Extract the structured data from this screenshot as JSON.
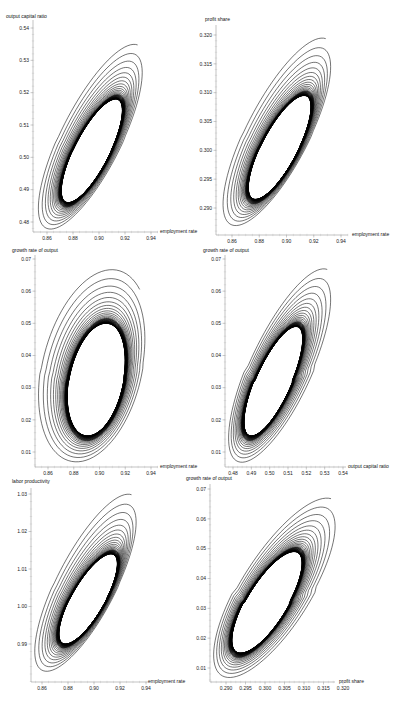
{
  "chart_data": [
    {
      "id": "c1",
      "type": "line",
      "title": "",
      "xlabel": "employment rate",
      "ylabel": "output capital ratio",
      "xlim": [
        0.85,
        0.95
      ],
      "ylim": [
        0.477,
        0.54
      ],
      "xticks": [
        0.86,
        0.88,
        0.9,
        0.92,
        0.94
      ],
      "xtick_labels": [
        "0.86",
        "0.88",
        "0.90",
        "0.92",
        "0.94"
      ],
      "yticks": [
        0.48,
        0.49,
        0.5,
        0.51,
        0.52,
        0.53,
        0.54
      ],
      "ytick_labels": [
        "0.48",
        "0.49",
        "0.50",
        "0.51",
        "0.52",
        "0.53",
        "0.54"
      ],
      "series": [
        {
          "name": "trajectory",
          "description": "spiral converging inward to a stable limit cycle",
          "start": [
            0.912,
            0.533
          ],
          "outer_orbit": {
            "x_range": [
              0.852,
              0.936
            ],
            "y_range": [
              0.477,
              0.535
            ]
          },
          "limit_cycle": {
            "x_range": [
              0.871,
              0.918
            ],
            "y_range": [
              0.486,
              0.518
            ]
          }
        }
      ]
    },
    {
      "id": "c2",
      "type": "line",
      "title": "",
      "xlabel": "employment rate",
      "ylabel": "profit share",
      "xlim": [
        0.85,
        0.95
      ],
      "ylim": [
        0.286,
        0.321
      ],
      "xticks": [
        0.86,
        0.88,
        0.9,
        0.92,
        0.94
      ],
      "xtick_labels": [
        "0.86",
        "0.88",
        "0.90",
        "0.92",
        "0.94"
      ],
      "yticks": [
        0.29,
        0.295,
        0.3,
        0.305,
        0.31,
        0.315,
        0.32
      ],
      "ytick_labels": [
        "0.290",
        "0.295",
        "0.300",
        "0.305",
        "0.310",
        "0.315",
        "0.320"
      ],
      "series": [
        {
          "name": "trajectory",
          "description": "spiral converging inward to a stable limit cycle",
          "start": [
            0.912,
            0.3175
          ],
          "outer_orbit": {
            "x_range": [
              0.852,
              0.935
            ],
            "y_range": [
              0.2865,
              0.3195
            ]
          },
          "limit_cycle": {
            "x_range": [
              0.872,
              0.918
            ],
            "y_range": [
              0.2915,
              0.3095
            ]
          }
        }
      ]
    },
    {
      "id": "c3",
      "type": "line",
      "title": "",
      "xlabel": "employment rate",
      "ylabel": "growth rate of output",
      "xlim": [
        0.85,
        0.95
      ],
      "ylim": [
        0.005,
        0.07
      ],
      "xticks": [
        0.86,
        0.88,
        0.9,
        0.92,
        0.94
      ],
      "xtick_labels": [
        "0.86",
        "0.88",
        "0.90",
        "0.92",
        "0.94"
      ],
      "yticks": [
        0.01,
        0.02,
        0.03,
        0.04,
        0.05,
        0.06,
        0.07
      ],
      "ytick_labels": [
        "0.01",
        "0.02",
        "0.03",
        "0.04",
        "0.05",
        "0.06",
        "0.07"
      ],
      "series": [
        {
          "name": "trajectory",
          "description": "spiral converging inward to a stable limit cycle",
          "start": [
            0.925,
            0.064
          ],
          "outer_orbit": {
            "x_range": [
              0.851,
              0.938
            ],
            "y_range": [
              0.006,
              0.067
            ]
          },
          "limit_cycle": {
            "x_range": [
              0.875,
              0.92
            ],
            "y_range": [
              0.015,
              0.05
            ]
          }
        }
      ]
    },
    {
      "id": "c4",
      "type": "line",
      "title": "",
      "xlabel": "output capital ratio",
      "ylabel": "growth rate of output",
      "xlim": [
        0.475,
        0.545
      ],
      "ylim": [
        0.005,
        0.07
      ],
      "xticks": [
        0.48,
        0.49,
        0.5,
        0.51,
        0.52,
        0.53,
        0.54
      ],
      "xtick_labels": [
        "0.48",
        "0.49",
        "0.50",
        "0.51",
        "0.52",
        "0.53",
        "0.54"
      ],
      "yticks": [
        0.01,
        0.02,
        0.03,
        0.04,
        0.05,
        0.06,
        0.07
      ],
      "ytick_labels": [
        "0.01",
        "0.02",
        "0.03",
        "0.04",
        "0.05",
        "0.06",
        "0.07"
      ],
      "series": [
        {
          "name": "trajectory",
          "description": "spiral converging inward to a stable limit cycle",
          "start": [
            0.533,
            0.064
          ],
          "outer_orbit": {
            "x_range": [
              0.477,
              0.536
            ],
            "y_range": [
              0.006,
              0.067
            ]
          },
          "limit_cycle": {
            "x_range": [
              0.486,
              0.518
            ],
            "y_range": [
              0.015,
              0.049
            ]
          }
        }
      ]
    },
    {
      "id": "c5",
      "type": "line",
      "title": "",
      "xlabel": "employment rate",
      "ylabel": "labor productivity",
      "xlim": [
        0.85,
        0.95
      ],
      "ylim": [
        0.98,
        1.033
      ],
      "xticks": [
        0.86,
        0.88,
        0.9,
        0.92,
        0.94
      ],
      "xtick_labels": [
        "0.86",
        "0.88",
        "0.90",
        "0.92",
        "0.94"
      ],
      "yticks": [
        0.99,
        1.0,
        1.01,
        1.02,
        1.03
      ],
      "ytick_labels": [
        "0.99",
        "1.00",
        "1.01",
        "1.02",
        "1.03"
      ],
      "series": [
        {
          "name": "trajectory",
          "description": "spiral converging inward to a stable limit cycle",
          "start": [
            0.914,
            1.028
          ],
          "outer_orbit": {
            "x_range": [
              0.853,
              0.935
            ],
            "y_range": [
              0.982,
              1.03
            ]
          },
          "limit_cycle": {
            "x_range": [
              0.873,
              0.918
            ],
            "y_range": [
              0.99,
              1.014
            ]
          }
        }
      ]
    },
    {
      "id": "c6",
      "type": "line",
      "title": "",
      "xlabel": "profit share",
      "ylabel": "growth rate of output",
      "xlim": [
        0.286,
        0.322
      ],
      "ylim": [
        0.005,
        0.071
      ],
      "xticks": [
        0.29,
        0.295,
        0.3,
        0.305,
        0.31,
        0.315,
        0.32
      ],
      "xtick_labels": [
        "0.290",
        "0.295",
        "0.300",
        "0.305",
        "0.310",
        "0.315",
        "0.320"
      ],
      "yticks": [
        0.01,
        0.02,
        0.03,
        0.04,
        0.05,
        0.06,
        0.07
      ],
      "ytick_labels": [
        "0.01",
        "0.02",
        "0.03",
        "0.04",
        "0.05",
        "0.06",
        "0.07"
      ],
      "series": [
        {
          "name": "trajectory",
          "description": "spiral converging inward to a stable limit cycle",
          "start": [
            0.318,
            0.064
          ],
          "outer_orbit": {
            "x_range": [
              0.2865,
              0.3195
            ],
            "y_range": [
              0.006,
              0.067
            ]
          },
          "limit_cycle": {
            "x_range": [
              0.2915,
              0.3095
            ],
            "y_range": [
              0.015,
              0.049
            ]
          }
        }
      ]
    }
  ]
}
